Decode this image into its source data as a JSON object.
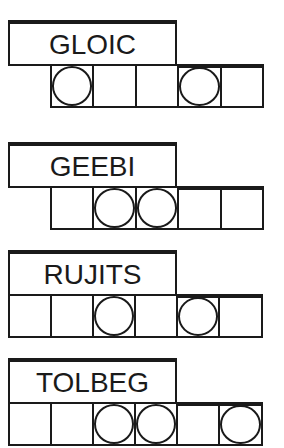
{
  "puzzle_type": "word-jumble",
  "puzzles": [
    {
      "scrambled": "GLOIC",
      "letter_count": 5,
      "circled_positions": [
        1,
        4
      ]
    },
    {
      "scrambled": "GEEBI",
      "letter_count": 5,
      "circled_positions": [
        2,
        3
      ]
    },
    {
      "scrambled": "RUJITS",
      "letter_count": 6,
      "circled_positions": [
        3,
        5
      ]
    },
    {
      "scrambled": "TOLBEG",
      "letter_count": 6,
      "circled_positions": [
        3,
        4,
        6
      ]
    }
  ],
  "colors": {
    "ink": "#1a1a1a",
    "background": "#ffffff"
  }
}
